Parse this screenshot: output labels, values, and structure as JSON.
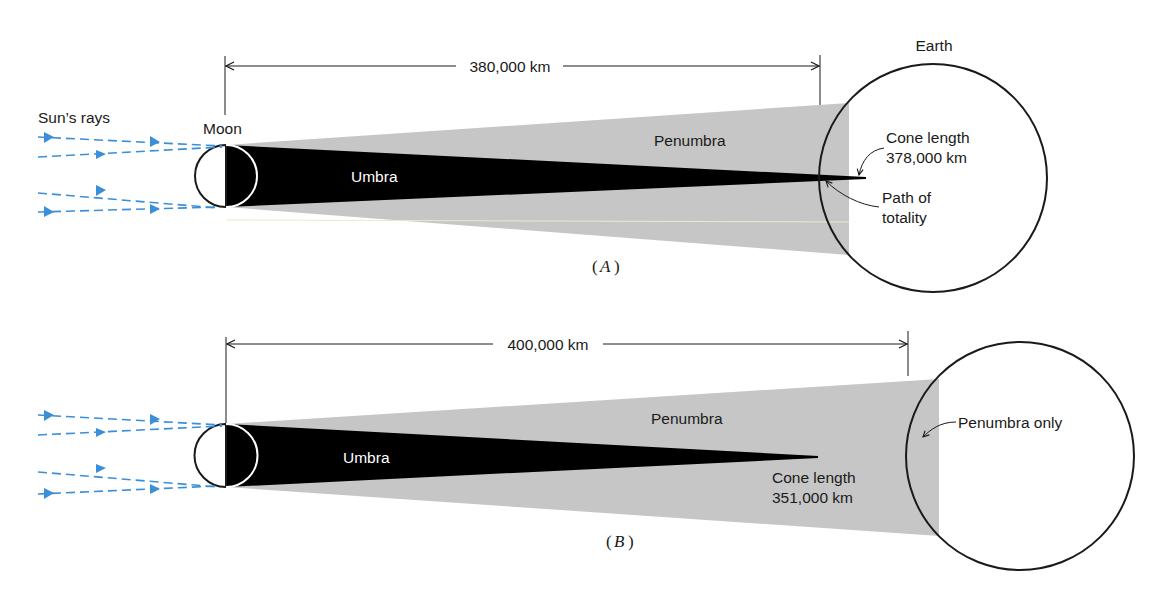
{
  "colors": {
    "penumbra": "#c6c6c6",
    "umbra": "#000000",
    "rays": "#3a8fd8",
    "outline": "#1a1a1a",
    "background": "#ffffff"
  },
  "panel_a": {
    "caption_letter": "A",
    "distance_label": "380,000 km",
    "sun_rays_label": "Sun’s rays",
    "moon_label": "Moon",
    "earth_label": "Earth",
    "umbra_label": "Umbra",
    "penumbra_label": "Penumbra",
    "cone_length_title": "Cone length",
    "cone_length_value": "378,000 km",
    "path_line1": "Path of",
    "path_line2": "totality"
  },
  "panel_b": {
    "caption_letter": "B",
    "distance_label": "400,000 km",
    "umbra_label": "Umbra",
    "penumbra_label": "Penumbra",
    "cone_length_title": "Cone length",
    "cone_length_value": "351,000 km",
    "penumbra_only_label": "Penumbra only"
  }
}
